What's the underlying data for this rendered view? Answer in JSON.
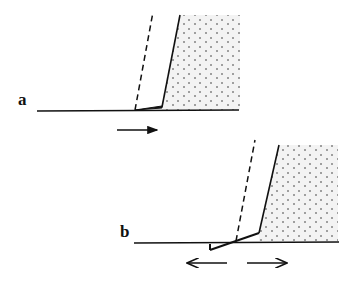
{
  "diagram": {
    "panels": [
      {
        "id": "a",
        "label": "a",
        "arrows": [
          "right"
        ]
      },
      {
        "id": "b",
        "label": "b",
        "arrows": [
          "left",
          "right"
        ]
      }
    ],
    "colors": {
      "line": "#111111",
      "stipple_fill": "#f2f2f2",
      "dots": "#333333",
      "background": "#ffffff"
    }
  }
}
